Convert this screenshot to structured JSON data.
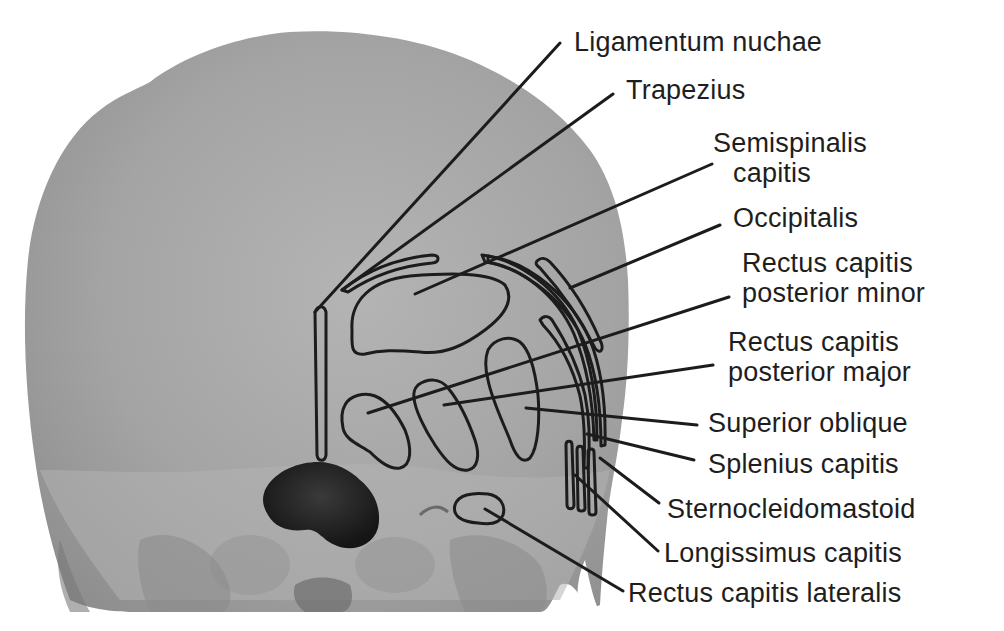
{
  "figure": {
    "colors": {
      "background": "#ffffff",
      "bone": "#a6a6a6",
      "bone_light": "#b8b8b8",
      "bone_shadow": "#7a7a7a",
      "foramen": "#262626",
      "outline": "#1c1c1c",
      "text": "#1e1e1e"
    }
  },
  "labels": [
    {
      "id": "ligamentum-nuchae",
      "lines": [
        "Ligamentum nuchae"
      ]
    },
    {
      "id": "trapezius",
      "lines": [
        "Trapezius"
      ]
    },
    {
      "id": "semispinalis-capitis",
      "lines": [
        "Semispinalis",
        "capitis"
      ]
    },
    {
      "id": "occipitalis",
      "lines": [
        "Occipitalis"
      ]
    },
    {
      "id": "rectus-capitis-posterior-minor",
      "lines": [
        "Rectus capitis",
        "posterior minor"
      ]
    },
    {
      "id": "rectus-capitis-posterior-major",
      "lines": [
        "Rectus capitis",
        "posterior major"
      ]
    },
    {
      "id": "superior-oblique",
      "lines": [
        "Superior oblique"
      ]
    },
    {
      "id": "splenius-capitis",
      "lines": [
        "Splenius capitis"
      ]
    },
    {
      "id": "sternocleidomastoid",
      "lines": [
        "Sternocleidomastoid"
      ]
    },
    {
      "id": "longissimus-capitis",
      "lines": [
        "Longissimus capitis"
      ]
    },
    {
      "id": "rectus-capitis-lateralis",
      "lines": [
        "Rectus capitis lateralis"
      ]
    }
  ]
}
